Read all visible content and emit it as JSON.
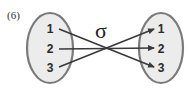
{
  "figure": {
    "number_label": "(6)",
    "mapping_symbol": "σ",
    "left_set": {
      "elements": [
        "1",
        "2",
        "3"
      ]
    },
    "right_set": {
      "elements": [
        "1",
        "2",
        "3"
      ]
    },
    "mapping": [
      {
        "from": "1",
        "to": "3"
      },
      {
        "from": "2",
        "to": "2"
      },
      {
        "from": "3",
        "to": "1"
      }
    ],
    "colors": {
      "ellipse_fill": "#ececec",
      "ellipse_stroke": "#7a7a7a",
      "arrow": "#3a3a3a"
    }
  }
}
